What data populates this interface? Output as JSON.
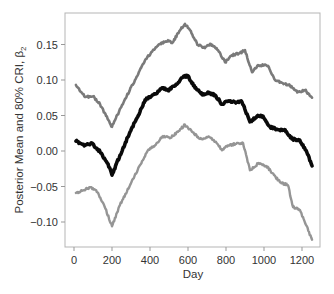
{
  "chart_data": {
    "type": "line",
    "title": "",
    "xlabel": "Day",
    "ylabel": "Posterior Mean and 80% CRI, β₂",
    "ylabel_main": "Posterior Mean and 80% CRI, ",
    "ylabel_symbol": "β",
    "ylabel_subscript": "2",
    "xlim": [
      -40,
      1290
    ],
    "ylim": [
      -0.135,
      0.195
    ],
    "x_ticks": [
      0,
      200,
      400,
      600,
      800,
      1000,
      1200
    ],
    "x_tick_labels": [
      "0",
      "200",
      "400",
      "600",
      "800",
      "1000",
      "1200"
    ],
    "y_ticks": [
      -0.1,
      -0.05,
      0.0,
      0.05,
      0.1,
      0.15
    ],
    "y_tick_labels": [
      "−0.10",
      "−0.05",
      "0.00",
      "0.05",
      "0.10",
      "0.15"
    ],
    "grid": false,
    "legend": null,
    "series": [
      {
        "name": "Upper 80% CRI",
        "color": "#7a7a7a",
        "width": 2.6,
        "x": [
          10,
          58,
          100,
          137,
          189,
          200,
          253,
          321,
          374,
          411,
          453,
          495,
          516,
          558,
          584,
          611,
          653,
          689,
          716,
          758,
          795,
          832,
          874,
          900,
          937,
          968,
          1021,
          1058,
          1095,
          1137,
          1179,
          1216,
          1253
        ],
        "y": [
          0.093,
          0.076,
          0.077,
          0.066,
          0.039,
          0.034,
          0.065,
          0.1,
          0.128,
          0.14,
          0.151,
          0.156,
          0.152,
          0.17,
          0.179,
          0.17,
          0.149,
          0.145,
          0.151,
          0.142,
          0.125,
          0.135,
          0.138,
          0.142,
          0.111,
          0.121,
          0.12,
          0.1,
          0.096,
          0.092,
          0.083,
          0.086,
          0.075
        ]
      },
      {
        "name": "Posterior Mean",
        "color": "#0a0a0a",
        "width": 3.6,
        "x": [
          10,
          58,
          95,
          137,
          179,
          200,
          242,
          295,
          347,
          374,
          426,
          463,
          495,
          537,
          574,
          600,
          637,
          679,
          705,
          742,
          779,
          811,
          847,
          884,
          926,
          963,
          995,
          1032,
          1074,
          1111,
          1147,
          1189,
          1221,
          1253
        ],
        "y": [
          0.014,
          0.008,
          0.011,
          -0.001,
          -0.018,
          -0.034,
          -0.006,
          0.027,
          0.055,
          0.072,
          0.08,
          0.089,
          0.085,
          0.094,
          0.104,
          0.106,
          0.089,
          0.079,
          0.083,
          0.079,
          0.066,
          0.07,
          0.069,
          0.069,
          0.041,
          0.049,
          0.049,
          0.034,
          0.03,
          0.03,
          0.017,
          0.015,
          0.001,
          -0.021
        ]
      },
      {
        "name": "Lower 80% CRI",
        "color": "#959595",
        "width": 2.4,
        "x": [
          10,
          42,
          84,
          116,
          158,
          200,
          242,
          295,
          347,
          389,
          426,
          468,
          505,
          547,
          584,
          621,
          663,
          705,
          747,
          779,
          811,
          853,
          890,
          926,
          968,
          1011,
          1053,
          1084,
          1126,
          1153,
          1189,
          1221,
          1253
        ],
        "y": [
          -0.059,
          -0.056,
          -0.051,
          -0.055,
          -0.076,
          -0.106,
          -0.076,
          -0.048,
          -0.02,
          0.001,
          0.008,
          0.021,
          0.018,
          0.027,
          0.037,
          0.027,
          0.017,
          0.02,
          0.013,
          0.001,
          0.008,
          0.01,
          0.011,
          -0.027,
          -0.018,
          -0.021,
          -0.034,
          -0.044,
          -0.048,
          -0.079,
          -0.083,
          -0.104,
          -0.125
        ]
      }
    ]
  },
  "colors": {
    "frame": "#b5b5b5",
    "tick": "#999999",
    "text": "#333333"
  }
}
